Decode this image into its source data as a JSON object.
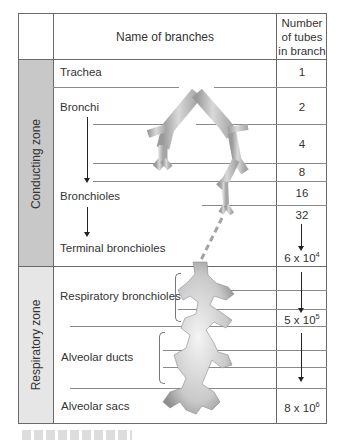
{
  "diagram": {
    "type": "table-diagram",
    "colors": {
      "conducting_zone_fill": "#c8c8c8",
      "respiratory_zone_fill": "#e6e6e6",
      "airway_fill": "#bdbdbd",
      "grid_line": "#8a8a8a"
    },
    "header": {
      "name_col": "Name of branches",
      "count_col_line1": "Number",
      "count_col_line2": "of tubes",
      "count_col_line3": "in branch"
    },
    "zones": [
      {
        "label": "Conducting zone"
      },
      {
        "label": "Respiratory zone"
      }
    ],
    "branches": [
      {
        "name": "Trachea",
        "zone": "Conducting zone"
      },
      {
        "name": "Bronchi",
        "zone": "Conducting zone"
      },
      {
        "name": "Bronchioles",
        "zone": "Conducting zone"
      },
      {
        "name": "Terminal bronchioles",
        "zone": "Conducting zone"
      },
      {
        "name": "Respiratory bronchioles",
        "zone": "Respiratory zone"
      },
      {
        "name": "Alveolar ducts",
        "zone": "Respiratory zone"
      },
      {
        "name": "Alveolar sacs",
        "zone": "Respiratory zone"
      }
    ],
    "counts": [
      {
        "value": "1"
      },
      {
        "value": "2"
      },
      {
        "value": "4"
      },
      {
        "value": "8"
      },
      {
        "value": "16"
      },
      {
        "value": "32"
      },
      {
        "base": "6 x 10",
        "exp": "4"
      },
      {
        "base": "5 x 10",
        "exp": "5"
      },
      {
        "base": "8 x 10",
        "exp": "6"
      }
    ]
  }
}
